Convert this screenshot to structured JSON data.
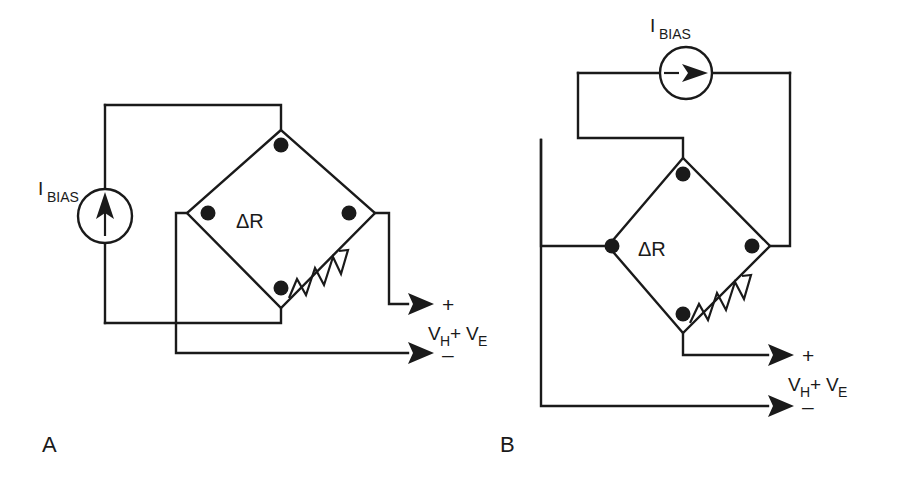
{
  "figure": {
    "caption_letters": [
      "A",
      "B"
    ],
    "stroke_color": "#1a1a1a",
    "background_color": "#ffffff"
  },
  "labels": {
    "bias_main": "I",
    "bias_sub": "BIAS",
    "delta_r": "ΔR",
    "plus": "+",
    "minus": "–",
    "v_main": "V",
    "v_sub_h": "H",
    "v_plus": "+",
    "v_main2": "V",
    "v_sub_e": "E",
    "panel_a": "A",
    "panel_b": "B"
  },
  "panels": [
    {
      "id": "A",
      "letter": "A",
      "source": {
        "name": "current-source",
        "label_main": "I",
        "label_sub": "BIAS",
        "direction": "up",
        "cx": 105,
        "cy": 216,
        "r": 27
      },
      "bridge": {
        "name": "wheatstone-bridge",
        "nodes": [
          {
            "name": "top-node",
            "x": 281,
            "y": 130
          },
          {
            "name": "left-node",
            "x": 187,
            "y": 213
          },
          {
            "name": "right-node",
            "x": 375,
            "y": 213
          },
          {
            "name": "bottom-node",
            "x": 281,
            "y": 308
          }
        ],
        "resistor_label": "ΔR",
        "resistor_edge": "bottom-right"
      },
      "output": {
        "plus_label": "+",
        "minus_label": "–",
        "voltage_label": "V_H + V_E"
      }
    },
    {
      "id": "B",
      "letter": "B",
      "source": {
        "name": "current-source",
        "label_main": "I",
        "label_sub": "BIAS",
        "direction": "right",
        "cx": 686,
        "cy": 73,
        "r": 26
      },
      "bridge": {
        "name": "wheatstone-bridge",
        "nodes": [
          {
            "name": "top-node",
            "x": 683,
            "y": 158
          },
          {
            "name": "left-node",
            "x": 608,
            "y": 246
          },
          {
            "name": "right-node",
            "x": 770,
            "y": 246
          },
          {
            "name": "bottom-node",
            "x": 683,
            "y": 333
          }
        ],
        "resistor_label": "ΔR",
        "resistor_edge": "bottom-right"
      },
      "output": {
        "plus_label": "+",
        "minus_label": "–",
        "voltage_label": "V_H + V_E"
      }
    }
  ]
}
